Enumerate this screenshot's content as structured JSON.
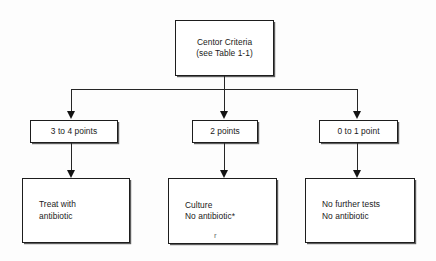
{
  "diagram": {
    "colors": {
      "background": "#fdfdfd",
      "node_fill": "#ffffff",
      "node_border": "#1d1d1d",
      "connector": "#262626",
      "text": "#1a1a1a"
    },
    "root": {
      "line1": "Centor Criteria",
      "line2": "(see Table 1-1)"
    },
    "criteria": [
      {
        "label": "3 to 4 points"
      },
      {
        "label": "2 points"
      },
      {
        "label": "0 to 1 point"
      }
    ],
    "actions": [
      {
        "line1": "Treat with",
        "line2": "antibiotic"
      },
      {
        "line1": "Culture",
        "line2": "No antibiotic*"
      },
      {
        "line1": "No further tests",
        "line2": "No antibiotic"
      }
    ],
    "artifact": "r"
  }
}
